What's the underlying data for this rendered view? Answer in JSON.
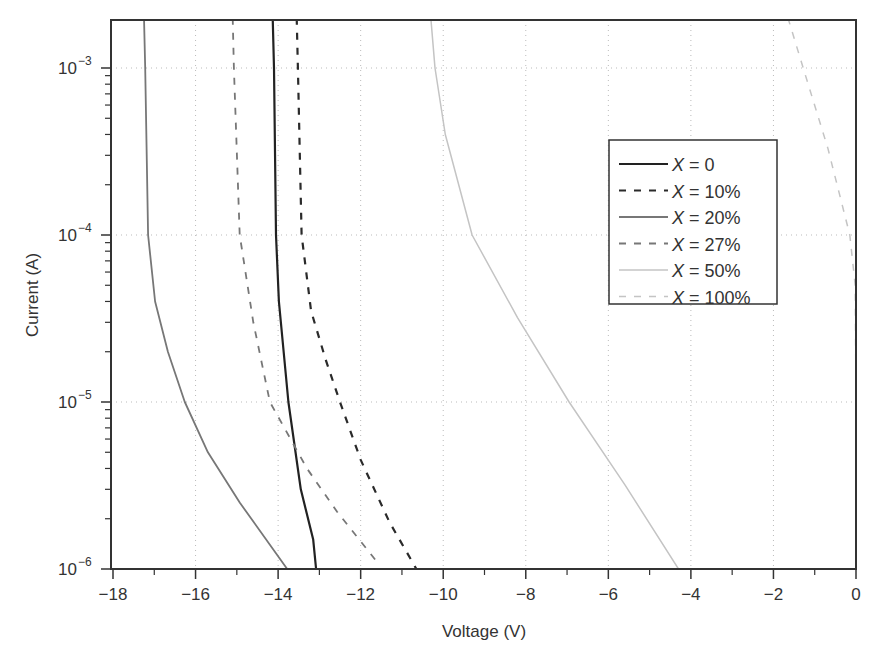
{
  "chart_data": {
    "type": "line",
    "title": "",
    "xlabel": "Voltage (V)",
    "ylabel": "Current (A)",
    "xlim": [
      -18,
      0
    ],
    "ylim": [
      1e-06,
      0.002
    ],
    "yscale": "log",
    "grid": true,
    "legend_position": "upper right (inside)",
    "x_ticks": [
      -18,
      -16,
      -14,
      -12,
      -10,
      -8,
      -6,
      -4,
      -2,
      0
    ],
    "x_tick_labels": [
      "−18",
      "−16",
      "−14",
      "−12",
      "−10",
      "−8",
      "−6",
      "−4",
      "−2",
      "0"
    ],
    "y_ticks": [
      1e-06,
      1e-05,
      0.0001,
      0.001
    ],
    "y_tick_labels": [
      {
        "base": "10",
        "exp": "−6"
      },
      {
        "base": "10",
        "exp": "−5"
      },
      {
        "base": "10",
        "exp": "−4"
      },
      {
        "base": "10",
        "exp": "−3"
      }
    ],
    "series": [
      {
        "name": "X = 0",
        "legend_var": "X",
        "legend_val": " = 0",
        "color": "#222222",
        "dash": "",
        "width": 2.2,
        "points": [
          [
            -14.13,
            0.002
          ],
          [
            -14.1,
            0.001
          ],
          [
            -14.05,
            0.0001
          ],
          [
            -13.98,
            4e-05
          ],
          [
            -13.75,
            1e-05
          ],
          [
            -13.45,
            3e-06
          ],
          [
            -13.15,
            1.5e-06
          ],
          [
            -13.08,
            1e-06
          ]
        ]
      },
      {
        "name": "X = 10%",
        "legend_var": "X",
        "legend_val": " = 10%",
        "color": "#2a2a2a",
        "dash": "7,8",
        "width": 2.2,
        "points": [
          [
            -13.55,
            0.002
          ],
          [
            -13.52,
            0.001
          ],
          [
            -13.43,
            0.0001
          ],
          [
            -13.2,
            3.5e-05
          ],
          [
            -12.85,
            1.8e-05
          ],
          [
            -12.5,
            1e-05
          ],
          [
            -12.0,
            4.5e-06
          ],
          [
            -11.3,
            1.9e-06
          ],
          [
            -10.65,
            1e-06
          ]
        ]
      },
      {
        "name": "X = 20%",
        "legend_var": "X",
        "legend_val": " = 20%",
        "color": "#777777",
        "dash": "",
        "width": 1.8,
        "points": [
          [
            -17.25,
            0.002
          ],
          [
            -17.22,
            0.001
          ],
          [
            -17.15,
            0.0001
          ],
          [
            -16.98,
            4e-05
          ],
          [
            -16.67,
            2e-05
          ],
          [
            -16.26,
            1e-05
          ],
          [
            -15.7,
            5e-06
          ],
          [
            -14.93,
            2.5e-06
          ],
          [
            -13.78,
            1e-06
          ]
        ]
      },
      {
        "name": "X = 27%",
        "legend_var": "X",
        "legend_val": " = 27%",
        "color": "#777777",
        "dash": "7,8",
        "width": 1.8,
        "points": [
          [
            -15.1,
            0.002
          ],
          [
            -15.07,
            0.001
          ],
          [
            -14.93,
            0.0001
          ],
          [
            -14.6,
            3e-05
          ],
          [
            -14.2,
            1e-05
          ],
          [
            -13.3,
            4e-06
          ],
          [
            -12.57,
            2.2e-06
          ],
          [
            -11.6,
            1.1e-06
          ]
        ]
      },
      {
        "name": "X = 50%",
        "legend_var": "X",
        "legend_val": " = 50%",
        "color": "#c4c4c4",
        "dash": "",
        "width": 1.5,
        "points": [
          [
            -10.3,
            0.002
          ],
          [
            -10.2,
            0.001
          ],
          [
            -9.95,
            0.0004
          ],
          [
            -9.3,
            0.0001
          ],
          [
            -8.2,
            3.2e-05
          ],
          [
            -6.95,
            1e-05
          ],
          [
            -5.6,
            3.2e-06
          ],
          [
            -4.3,
            1e-06
          ]
        ]
      },
      {
        "name": "X = 100%",
        "legend_var": "X",
        "legend_val": " = 100%",
        "color": "#c4c4c4",
        "dash": "7,8",
        "width": 1.5,
        "points": [
          [
            -1.65,
            0.002
          ],
          [
            -1.28,
            0.001
          ],
          [
            -0.68,
            0.00033
          ],
          [
            -0.15,
            0.0001
          ],
          [
            -0.02,
            5e-05
          ],
          [
            0,
            1e-05
          ],
          [
            0,
            1e-06
          ]
        ]
      }
    ]
  }
}
